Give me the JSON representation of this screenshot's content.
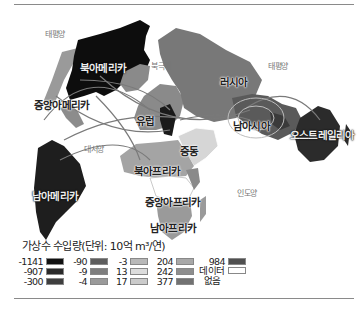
{
  "legend": {
    "title": "가상수 수입량(단위: 10억 m³/연)",
    "columns": [
      [
        {
          "value": "-1141",
          "color": "#111111"
        },
        {
          "value": "-907",
          "color": "#2a2a2a"
        },
        {
          "value": "-300",
          "color": "#3e3e3e"
        }
      ],
      [
        {
          "value": "-90",
          "color": "#5e5e5e"
        },
        {
          "value": "-9",
          "color": "#7e7e7e"
        },
        {
          "value": "-4",
          "color": "#9a9a9a"
        }
      ],
      [
        {
          "value": "-3",
          "color": "#b8b8b8"
        },
        {
          "value": "13",
          "color": "#dcdcdc"
        },
        {
          "value": "17",
          "color": "#cbcbcb"
        }
      ],
      [
        {
          "value": "204",
          "color": "#a8a8a8"
        },
        {
          "value": "242",
          "color": "#8e8e8e"
        },
        {
          "value": "377",
          "color": "#727272"
        }
      ],
      [
        {
          "value": "984",
          "color": "#505050"
        },
        {
          "value": "데이터 없음",
          "color": "#ffffff"
        }
      ]
    ]
  },
  "oceans": {
    "pacific_west": "태평양",
    "arctic": "북극해",
    "pacific_east": "태평양",
    "atlantic": "대서양",
    "indian": "인도양"
  },
  "regions": {
    "north_america": "북아메리카",
    "central_america": "중앙아메리카",
    "south_america": "남아메리카",
    "europe": "유럽",
    "russia": "러시아",
    "middle_east": "중동",
    "north_africa": "북아프리카",
    "central_africa": "중앙아프리카",
    "south_africa": "남아프리카",
    "south_asia": "남아시아",
    "australia": "오스트레일리아"
  },
  "region_colors": {
    "north_america": "#0d0d0d",
    "south_america": "#1e1e1e",
    "australia": "#2b2b2b",
    "europe": "#8a8a8a",
    "europe_east": "#1a1a1a",
    "russia": "#787878",
    "south_asia": "#5a5a5a",
    "middle_east": "#d6d6d6",
    "north_africa": "#a4a4a4",
    "central_africa": "#ffffff",
    "south_africa": "#9a9a9a",
    "greenland": "#8a8a8a",
    "alaska": "#9a9a9a",
    "flow_lines": "#7a7a7a"
  }
}
